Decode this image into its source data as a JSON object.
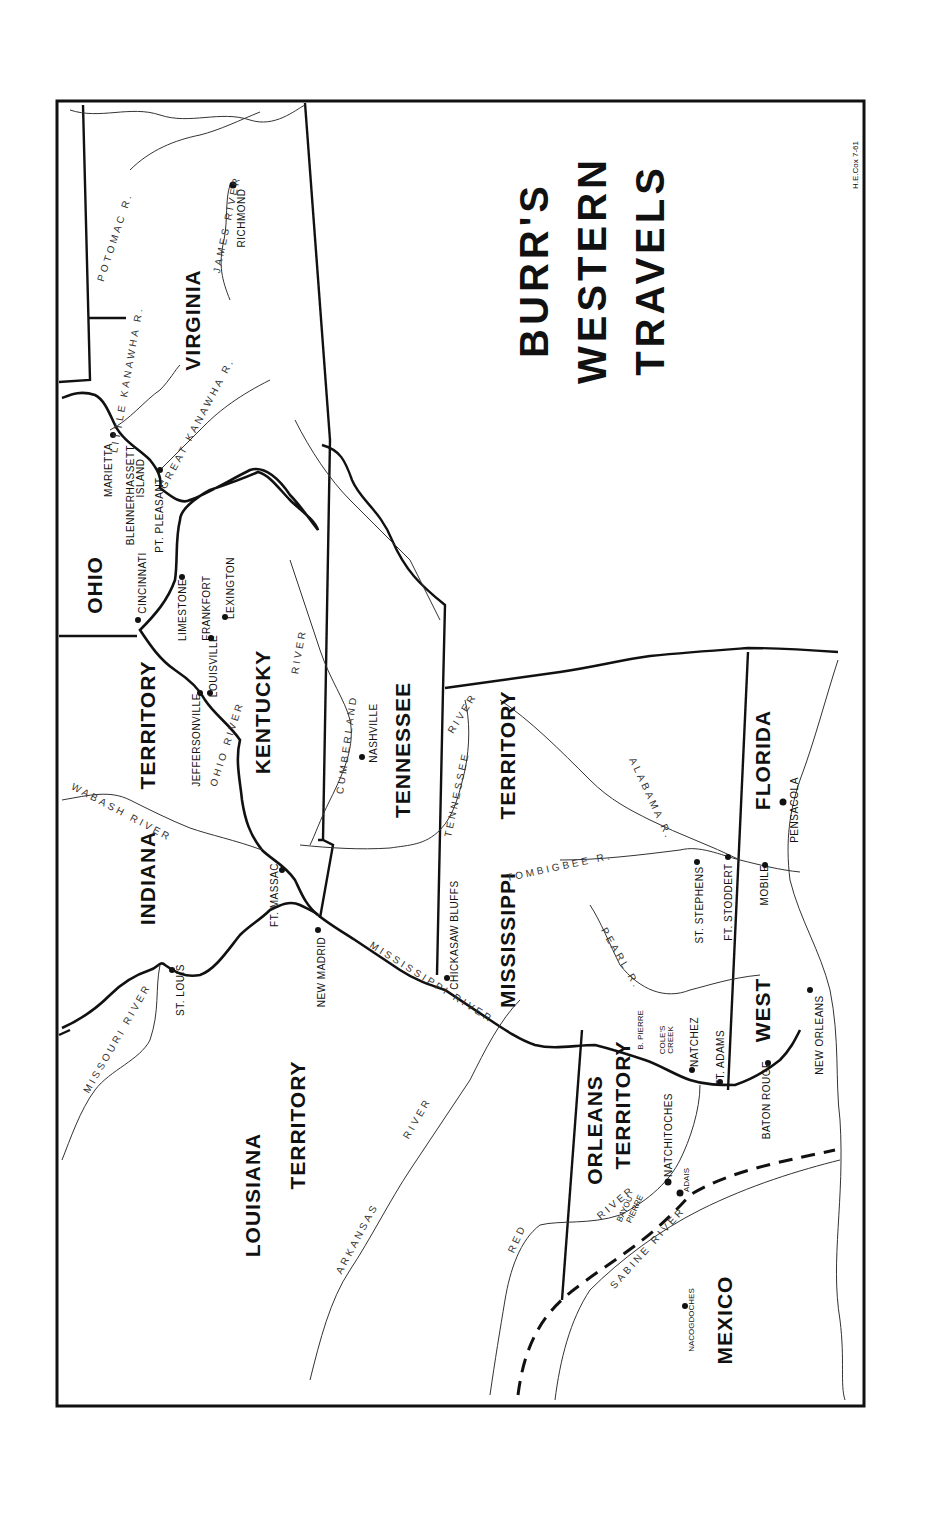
{
  "title": {
    "line1": "BURR'S",
    "line2": "WESTERN",
    "line3": "TRAVELS"
  },
  "credit": "H.E.Cox 7-61",
  "regions": {
    "virginia": "VIRGINIA",
    "ohio": "OHIO",
    "kentucky": "KENTUCKY",
    "tennessee": "TENNESSEE",
    "indiana": "INDIANA",
    "indiana_territory": "TERRITORY",
    "mississippi": "MISSISSIPPI",
    "mississippi_territory": "TERRITORY",
    "louisiana": "LOUISIANA",
    "louisiana_territory": "TERRITORY",
    "orleans": "ORLEANS",
    "orleans_territory": "TERRITORY",
    "florida": "FLORIDA",
    "west": "WEST",
    "mexico": "MEXICO"
  },
  "places": {
    "richmond": "RICHMOND",
    "marietta": "MARIETTA",
    "blennerhassett_1": "BLENNERHASSETT",
    "blennerhassett_2": "ISLAND",
    "pt_pleasant": "PT. PLEASANT",
    "cincinnati": "CINCINNATI",
    "limestone": "LIMESTONE",
    "frankfort": "FRANKFORT",
    "lexington": "LEXINGTON",
    "louisville": "LOUISVILLE",
    "jeffersonville": "JEFFERSONVILLE",
    "nashville": "NASHVILLE",
    "ft_massac": "FT. MASSAC",
    "new_madrid": "NEW MADRID",
    "st_louis": "ST. LOUIS",
    "chickasaw_bluffs": "CHICKASAW BLUFFS",
    "st_stephens": "ST. STEPHENS",
    "ft_stoddert": "FT. STODDERT",
    "mobile": "MOBILE",
    "pensacola": "PENSACOLA",
    "b_pierre": "B. PIERRE",
    "coles_creek_1": "COLE'S",
    "coles_creek_2": "CREEK",
    "natchez": "NATCHEZ",
    "ft_adams": "FT. ADAMS",
    "baton_rouge": "BATON ROUGE",
    "new_orleans": "NEW ORLEANS",
    "natchitoches": "NATCHITOCHES",
    "adais": "ADAIS",
    "bayou_pierre_1": "BAYOU",
    "bayou_pierre_2": "PIERRE",
    "nacogdoches": "NACOGDOCHES"
  },
  "rivers": {
    "potomac": "POTOMAC R.",
    "james": "JAMES RIVER",
    "little_kanawha": "LITTLE KANAWHA R.",
    "great_kanawha": "GREAT KANAWHA R.",
    "ohio": "OHIO RIVER",
    "wabash": "WABASH RIVER",
    "cumberland": "CUMBERLAND",
    "cumberland_river": "RIVER",
    "tennessee": "TENNESSEE",
    "tennessee_river": "RIVER",
    "mississippi": "MISSISSIPPI RIVER",
    "missouri": "MISSOURI RIVER",
    "arkansas": "ARKANSAS",
    "arkansas_river": "RIVER",
    "red": "RED",
    "red_river": "RIVER",
    "sabine": "SABINE RIVER",
    "tombigbee": "TOMBIGBEE R.",
    "alabama": "ALABAMA R.",
    "pearl": "PEARL R."
  }
}
